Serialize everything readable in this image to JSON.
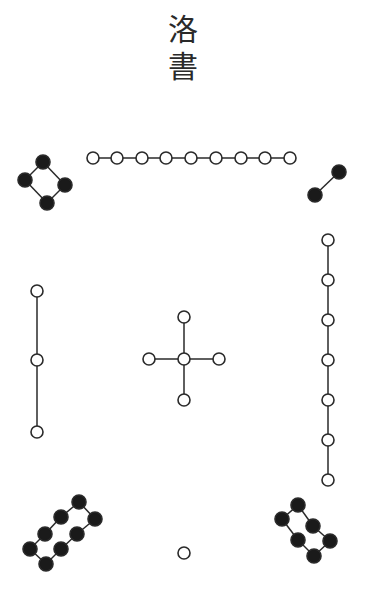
{
  "title": {
    "line1": "洛",
    "line2": "書"
  },
  "colors": {
    "stroke": "#2a2a2a",
    "yang": "#ffffff",
    "yin": "#1a1a1a"
  },
  "groups": [
    {
      "name": "nine-white",
      "value": 9,
      "kind": "yang",
      "dots": [
        [
          93,
          158
        ],
        [
          117,
          158
        ],
        [
          142,
          158
        ],
        [
          166,
          158
        ],
        [
          191,
          158
        ],
        [
          216,
          158
        ],
        [
          241,
          158
        ],
        [
          265,
          158
        ],
        [
          290,
          158
        ]
      ],
      "edges": [
        [
          0,
          1
        ],
        [
          1,
          2
        ],
        [
          2,
          3
        ],
        [
          3,
          4
        ],
        [
          4,
          5
        ],
        [
          5,
          6
        ],
        [
          6,
          7
        ],
        [
          7,
          8
        ]
      ]
    },
    {
      "name": "four-black",
      "value": 4,
      "kind": "yin",
      "dots": [
        [
          43,
          162
        ],
        [
          25,
          180
        ],
        [
          65,
          185
        ],
        [
          47,
          203
        ]
      ],
      "edges": [
        [
          0,
          1
        ],
        [
          0,
          2
        ],
        [
          1,
          3
        ],
        [
          2,
          3
        ]
      ]
    },
    {
      "name": "two-black",
      "value": 2,
      "kind": "yin",
      "dots": [
        [
          339,
          172
        ],
        [
          315,
          195
        ]
      ],
      "edges": [
        [
          0,
          1
        ]
      ]
    },
    {
      "name": "seven-white",
      "value": 7,
      "kind": "yang",
      "dots": [
        [
          328,
          240
        ],
        [
          328,
          280
        ],
        [
          328,
          320
        ],
        [
          328,
          360
        ],
        [
          328,
          400
        ],
        [
          328,
          440
        ],
        [
          328,
          480
        ]
      ],
      "edges": [
        [
          0,
          1
        ],
        [
          1,
          2
        ],
        [
          2,
          3
        ],
        [
          3,
          4
        ],
        [
          4,
          5
        ],
        [
          5,
          6
        ]
      ]
    },
    {
      "name": "three-white",
      "value": 3,
      "kind": "yang",
      "dots": [
        [
          37,
          291
        ],
        [
          37,
          360
        ],
        [
          37,
          432
        ]
      ],
      "edges": [
        [
          0,
          1
        ],
        [
          1,
          2
        ]
      ]
    },
    {
      "name": "five-white",
      "value": 5,
      "kind": "yang",
      "dots": [
        [
          184,
          359
        ],
        [
          184,
          317
        ],
        [
          184,
          400
        ],
        [
          149,
          359
        ],
        [
          219,
          359
        ]
      ],
      "edges": [
        [
          0,
          1
        ],
        [
          0,
          2
        ],
        [
          0,
          3
        ],
        [
          0,
          4
        ]
      ]
    },
    {
      "name": "eight-black",
      "value": 8,
      "kind": "yin",
      "dots": [
        [
          79,
          502
        ],
        [
          61,
          517
        ],
        [
          45,
          534
        ],
        [
          30,
          549
        ],
        [
          46,
          564
        ],
        [
          61,
          549
        ],
        [
          77,
          534
        ],
        [
          95,
          519
        ]
      ],
      "edges": [
        [
          0,
          1
        ],
        [
          1,
          2
        ],
        [
          2,
          3
        ],
        [
          3,
          4
        ],
        [
          4,
          5
        ],
        [
          5,
          6
        ],
        [
          6,
          7
        ],
        [
          7,
          0
        ]
      ]
    },
    {
      "name": "six-black",
      "value": 6,
      "kind": "yin",
      "dots": [
        [
          298,
          505
        ],
        [
          282,
          519
        ],
        [
          298,
          540
        ],
        [
          314,
          556
        ],
        [
          330,
          541
        ],
        [
          313,
          526
        ]
      ],
      "edges": [
        [
          0,
          1
        ],
        [
          1,
          2
        ],
        [
          2,
          3
        ],
        [
          3,
          4
        ],
        [
          4,
          5
        ],
        [
          5,
          0
        ]
      ]
    },
    {
      "name": "one-white",
      "value": 1,
      "kind": "yang",
      "dots": [
        [
          184,
          553
        ]
      ],
      "edges": []
    }
  ]
}
